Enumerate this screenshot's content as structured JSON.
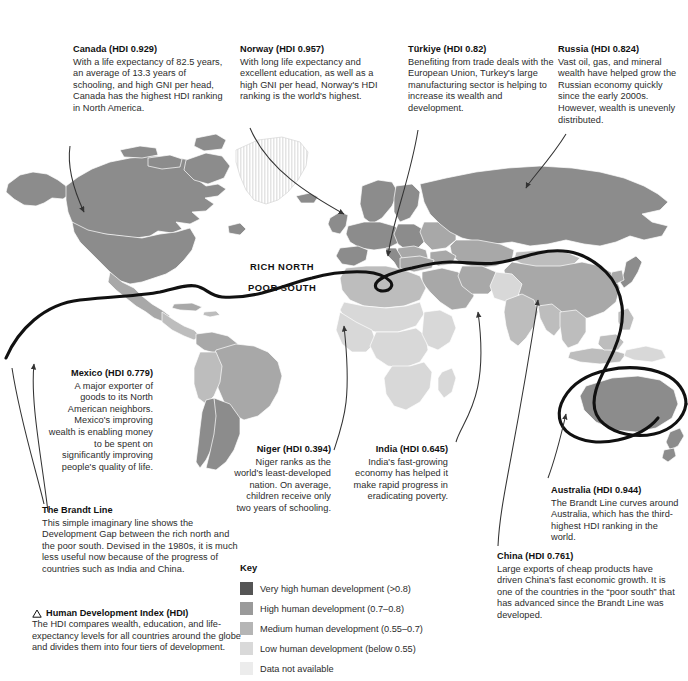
{
  "map": {
    "title": "World Human Development Index map with the Brandt Line",
    "brandt_labels": {
      "north": "RICH NORTH",
      "south": "POOR SOUTH"
    },
    "colors": {
      "very_high": "#8c8c8c",
      "high": "#a8a8a8",
      "medium": "#bdbdbd",
      "low": "#d8d8d8",
      "no_data": "#e9e9e9",
      "border": "#ffffff",
      "ocean": "#ffffff",
      "brandt_line": "#111111",
      "leader_line": "#333333",
      "text": "#2b2b2b",
      "heading": "#111111"
    }
  },
  "notes": [
    {
      "id": "canada",
      "title": "Canada (HDI 0.929)",
      "body": "With a life expectancy of 82.5 years, an average of 13.3 years of schooling, and high GNI per head, Canada has the highest HDI ranking in North America."
    },
    {
      "id": "norway",
      "title": "Norway (HDI 0.957)",
      "body": "With long life expectancy and excellent education, as well as a high GNI per head, Norway's HDI ranking is the world's highest."
    },
    {
      "id": "turkiye",
      "title": "Türkiye (HDI 0.82)",
      "body": "Benefiting from trade deals with the European Union, Turkey's large manufacturing sector is helping to increase its wealth and development."
    },
    {
      "id": "russia",
      "title": "Russia (HDI 0.824)",
      "body": "Vast oil, gas, and mineral wealth have helped grow the Russian economy quickly since the early 2000s. However, wealth is unevenly distributed."
    },
    {
      "id": "mexico",
      "title": "Mexico (HDI 0.779)",
      "body": "A major exporter of goods to its North American neighbors. Mexico's improving wealth is enabling money to be spent on significantly improving people's quality of life."
    },
    {
      "id": "niger",
      "title": "Niger (HDI 0.394)",
      "body": "Niger ranks as the world's least-developed nation. On average, children receive only two years of schooling."
    },
    {
      "id": "india",
      "title": "India (HDI 0.645)",
      "body": "India's fast-growing economy has helped it make rapid progress in eradicating poverty."
    },
    {
      "id": "australia",
      "title": "Australia (HDI 0.944)",
      "body": "The Brandt Line curves around Australia, which has the third-highest HDI ranking in the world."
    },
    {
      "id": "china",
      "title": "China (HDI 0.761)",
      "body": "Large exports of cheap products have driven China's fast economic growth. It is one of the countries in the “poor south” that has advanced since the Brandt Line was developed."
    },
    {
      "id": "brandt",
      "title": "The Brandt Line",
      "body": "This simple imaginary line shows the Development Gap between the rich north and the poor south. Devised in the 1980s, it is much less useful now because of the progress of countries such as India and China."
    }
  ],
  "hdi_block": {
    "icon": "triangle-icon",
    "title": "Human Development Index (HDI)",
    "body": "The HDI compares wealth, education, and life-expectancy levels for all countries around the globe and divides them into four tiers of development."
  },
  "key": {
    "heading": "Key",
    "items": [
      {
        "label": "Very high human development (>0.8)",
        "color": "#555555"
      },
      {
        "label": "High human development (0.7–0.8)",
        "color": "#9a9a9a"
      },
      {
        "label": "Medium human development (0.55–0.7)",
        "color": "#b5b5b5"
      },
      {
        "label": "Low human development (below 0.55)",
        "color": "#d9d9d9"
      },
      {
        "label": "Data not available",
        "color": "#ececec"
      }
    ]
  }
}
